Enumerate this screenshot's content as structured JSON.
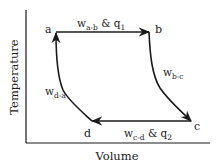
{
  "diagram": {
    "type": "thermodynamic-cycle",
    "axes": {
      "x_label": "Volume",
      "y_label": "Temperature"
    },
    "points": {
      "a": "a",
      "b": "b",
      "c": "c",
      "d": "d"
    },
    "processes": {
      "ab": {
        "w": "w",
        "sub": "a-b",
        "amp": " & ",
        "q": "q",
        "q_sub": "1"
      },
      "bc": {
        "w": "w",
        "sub": "b-c"
      },
      "cd": {
        "w": "w",
        "sub": "c-d",
        "amp": " & ",
        "q": "q",
        "q_sub": "2"
      },
      "da": {
        "w": "w",
        "sub": "d-a"
      }
    },
    "colors": {
      "stroke": "#1a1a1a",
      "text": "#222222",
      "background": "#ffffff"
    }
  }
}
